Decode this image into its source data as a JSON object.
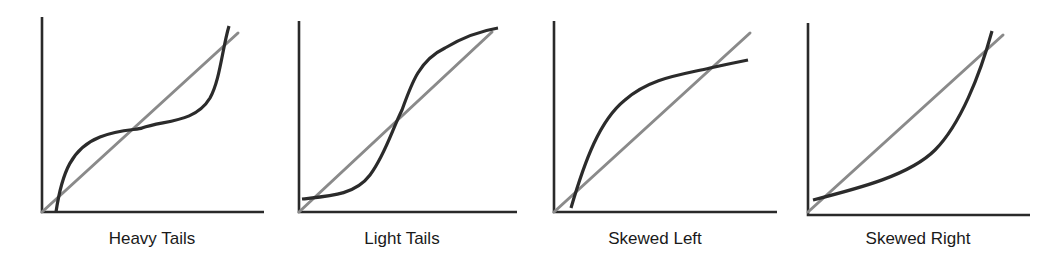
{
  "figure": {
    "colors": {
      "axis": "#2a2a2a",
      "reference_line": "#8a8a8a",
      "data_curve": "#2b2b2b",
      "background": "#ffffff"
    },
    "panels": [
      {
        "id": "heavy-tails",
        "label": "Heavy Tails",
        "label_x": 152,
        "axes": {
          "origin": [
            42,
            212
          ],
          "y_top": 17,
          "x_end": 264
        },
        "reference_line": {
          "from": [
            42,
            212
          ],
          "to": [
            238,
            33
          ]
        },
        "curve_path": "M 56 212 C 62 172, 72 148, 100 137 C 120 129, 138 130, 142 128 C 165 120, 195 123, 210 98 C 220 80, 222 50, 229 26"
      },
      {
        "id": "light-tails",
        "label": "Light Tails",
        "label_x": 402,
        "axes": {
          "origin": [
            299,
            212
          ],
          "y_top": 21,
          "x_end": 517
        },
        "reference_line": {
          "from": [
            299,
            212
          ],
          "to": [
            492,
            32
          ]
        },
        "curve_path": "M 302 199 C 330 196, 355 195, 370 175 C 385 155, 392 130, 402 110 C 412 82, 420 60, 445 48 C 465 36, 480 31, 498 28"
      },
      {
        "id": "skewed-left",
        "label": "Skewed Left",
        "label_x": 655,
        "axes": {
          "origin": [
            554,
            212
          ],
          "y_top": 21,
          "x_end": 777
        },
        "reference_line": {
          "from": [
            554,
            212
          ],
          "to": [
            750,
            33
          ]
        },
        "curve_path": "M 571 208 C 585 160, 600 120, 625 100 C 650 78, 680 75, 710 68 C 728 64, 738 62, 748 60"
      },
      {
        "id": "skewed-right",
        "label": "Skewed Right",
        "label_x": 918,
        "axes": {
          "origin": [
            808,
            215
          ],
          "y_top": 23,
          "x_end": 1030
        },
        "reference_line": {
          "from": [
            808,
            212
          ],
          "to": [
            1003,
            35
          ]
        },
        "curve_path": "M 813 200 C 860 188, 910 175, 935 150 C 960 125, 980 75, 992 31"
      }
    ]
  }
}
